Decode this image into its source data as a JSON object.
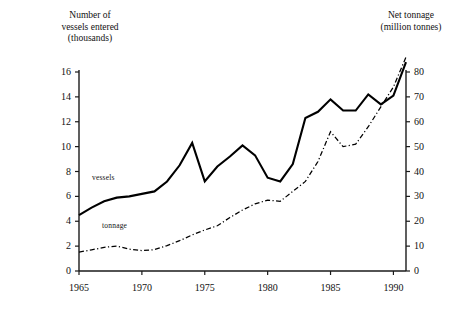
{
  "chart_data": {
    "type": "line",
    "title": "",
    "xlabel": "",
    "left_axis": {
      "label": "Number of\nvessels entered\n(thousands)",
      "ticks": [
        0,
        2,
        4,
        6,
        8,
        10,
        12,
        14,
        16
      ],
      "ylim": [
        0,
        16
      ]
    },
    "right_axis": {
      "label": "Net tonnage\n(million tonnes)",
      "ticks": [
        0,
        10,
        20,
        30,
        40,
        50,
        60,
        70,
        80
      ],
      "ylim": [
        0,
        80
      ]
    },
    "x": [
      1965,
      1966,
      1967,
      1968,
      1969,
      1970,
      1971,
      1972,
      1973,
      1974,
      1975,
      1976,
      1977,
      1978,
      1979,
      1980,
      1981,
      1982,
      1983,
      1984,
      1985,
      1986,
      1987,
      1988,
      1989,
      1990,
      1991
    ],
    "xticks": [
      1965,
      1970,
      1975,
      1980,
      1985,
      1990
    ],
    "xlim": [
      1965,
      1991
    ],
    "grid": false,
    "legend_position": "inline-annotations",
    "series": [
      {
        "name": "vessels",
        "axis": "left",
        "style": "solid",
        "color": "#000000",
        "values": [
          4.5,
          5.1,
          5.6,
          5.9,
          6.0,
          6.2,
          6.4,
          7.2,
          8.5,
          10.3,
          7.2,
          8.4,
          9.2,
          10.1,
          9.3,
          7.5,
          7.2,
          8.6,
          12.3,
          12.8,
          13.8,
          12.9,
          12.9,
          14.2,
          13.4,
          14.1,
          16.8
        ]
      },
      {
        "name": "tonnage",
        "axis": "right",
        "style": "dashed",
        "color": "#000000",
        "values": [
          7.6,
          8.5,
          9.5,
          10.0,
          8.8,
          8.2,
          8.6,
          10.2,
          12.2,
          14.5,
          16.5,
          18.2,
          21.5,
          24.5,
          27.0,
          28.5,
          28.0,
          32.0,
          36.0,
          44.0,
          56.0,
          50.0,
          51.0,
          58.0,
          66.0,
          74.0,
          86.0
        ]
      }
    ],
    "annotations": [
      {
        "name": "vessels",
        "text": "vessels"
      },
      {
        "name": "tonnage",
        "text": "tonnage"
      }
    ]
  },
  "axes": {
    "left_title": "Number of\nvessels entered\n(thousands)",
    "right_title": "Net tonnage\n(million tonnes)",
    "left_ticks": [
      "16",
      "14",
      "12",
      "10",
      "8",
      "6",
      "4",
      "2",
      "0"
    ],
    "right_ticks": [
      "80",
      "70",
      "60",
      "50",
      "40",
      "30",
      "20",
      "10",
      "0"
    ],
    "x_ticks": [
      "1965",
      "1970",
      "1975",
      "1980",
      "1985",
      "1990"
    ]
  },
  "labels": {
    "vessels": "vessels",
    "tonnage": "tonnage"
  }
}
